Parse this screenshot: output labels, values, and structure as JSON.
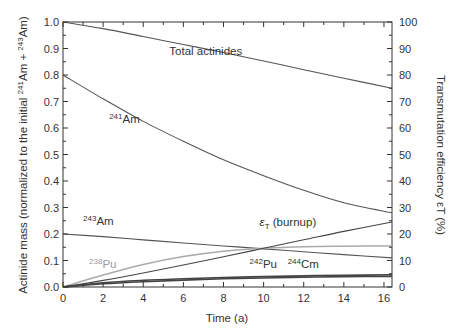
{
  "chart_data": {
    "type": "line",
    "title": "",
    "xlabel": "Time  (a)",
    "ylabel": "Actinide mass (normalized to the initial 241Am + 243Am)",
    "ylabel_parts": {
      "pre": "Actinide mass (normalized to the initial ",
      "sup1": "241",
      "mid": "Am + ",
      "sup2": "243",
      "post": "Am)"
    },
    "y2label": "Transmutation efficiency εT (%)",
    "xlim": [
      0,
      16.4
    ],
    "ylim": [
      0,
      1.0
    ],
    "y2lim": [
      0,
      100
    ],
    "x_ticks": [
      "0",
      "2",
      "4",
      "6",
      "8",
      "10",
      "12",
      "14",
      "16"
    ],
    "y_ticks": [
      "0.0",
      "0.1",
      "0.2",
      "0.3",
      "0.4",
      "0.5",
      "0.6",
      "0.7",
      "0.8",
      "0.9",
      "1.0"
    ],
    "y2_ticks": [
      "0",
      "10",
      "20",
      "30",
      "40",
      "50",
      "60",
      "70",
      "80",
      "90",
      "100"
    ],
    "grid": false,
    "legend": "inline annotations",
    "x": [
      0,
      2,
      4,
      6,
      8,
      10,
      12,
      14,
      16.4
    ],
    "series": [
      {
        "name": "Total actinides",
        "axis": "left",
        "color": "#555555",
        "values": [
          1.0,
          0.975,
          0.945,
          0.915,
          0.885,
          0.853,
          0.82,
          0.788,
          0.75
        ]
      },
      {
        "name": "241Am",
        "axis": "left",
        "color": "#555555",
        "values": [
          0.8,
          0.71,
          0.625,
          0.55,
          0.48,
          0.42,
          0.365,
          0.318,
          0.28
        ]
      },
      {
        "name": "243Am",
        "axis": "left",
        "color": "#555555",
        "values": [
          0.2,
          0.19,
          0.178,
          0.166,
          0.155,
          0.144,
          0.133,
          0.122,
          0.11
        ]
      },
      {
        "name": "238Pu",
        "axis": "left",
        "color": "#aaaaaa",
        "values": [
          0.0,
          0.045,
          0.085,
          0.115,
          0.135,
          0.146,
          0.152,
          0.154,
          0.155
        ]
      },
      {
        "name": "242Pu",
        "axis": "left",
        "color": "#444444",
        "values": [
          0.0,
          0.016,
          0.025,
          0.031,
          0.036,
          0.039,
          0.042,
          0.044,
          0.046
        ]
      },
      {
        "name": "244Cm",
        "axis": "left",
        "color": "#444444",
        "values": [
          0.0,
          0.012,
          0.02,
          0.026,
          0.031,
          0.034,
          0.037,
          0.039,
          0.04
        ]
      },
      {
        "name": "εT (burnup)",
        "axis": "right",
        "color": "#444444",
        "values": [
          0.0,
          2.5,
          5.3,
          8.3,
          11.4,
          14.6,
          17.8,
          21.0,
          24.5
        ]
      }
    ],
    "annotations": [
      {
        "text": "Total actinides",
        "x": 5.3,
        "y": 0.875
      },
      {
        "sup": "241",
        "text": "Am",
        "x": 2.3,
        "y": 0.62
      },
      {
        "sup": "243",
        "text": "Am",
        "x": 1.0,
        "y": 0.235
      },
      {
        "sup": "238",
        "text": "Pu",
        "x": 1.3,
        "y": 0.07,
        "light": true
      },
      {
        "sup": "242",
        "text": "Pu",
        "x": 9.3,
        "y": 0.07
      },
      {
        "sup": "244",
        "text": "Cm",
        "x": 11.2,
        "y": 0.07
      },
      {
        "text": "εT (burnup)",
        "x": 9.8,
        "y": 0.23
      }
    ]
  }
}
